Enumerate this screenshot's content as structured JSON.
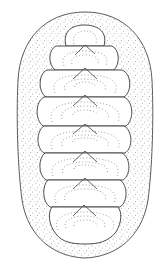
{
  "figure": {
    "subject": "chiton (polyplacophoran mollusk), dorsal view line drawing",
    "plate_count": 8,
    "colors": {
      "background": "#ffffff",
      "outline": "#4a4a4a",
      "girdle_stipple": "#9a9a9a",
      "growth_lines": "#8a8a8a"
    }
  }
}
